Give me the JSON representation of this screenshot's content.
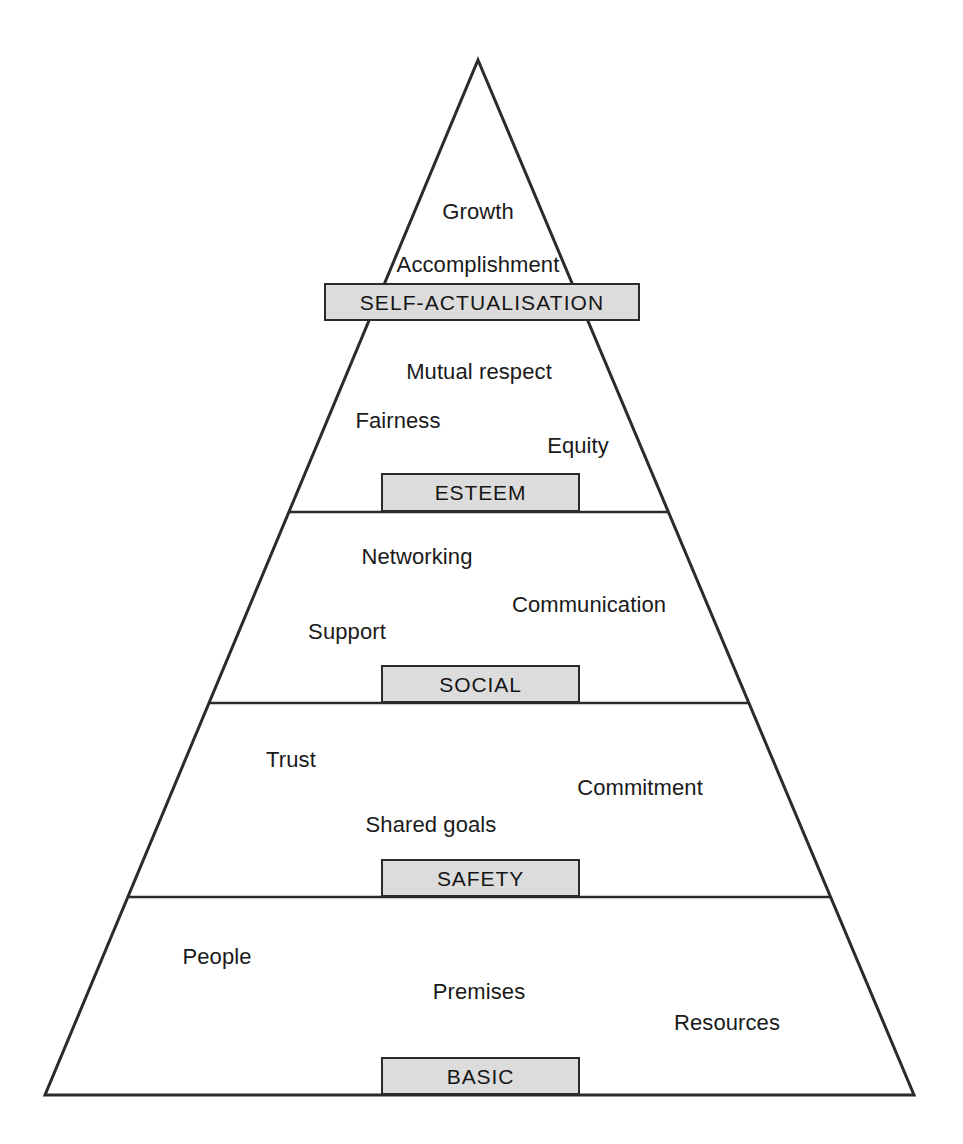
{
  "diagram": {
    "type": "pyramid-hierarchy",
    "title": "",
    "background_color": "#ffffff",
    "outline_color": "#2b2b2b",
    "box_fill_color": "#dcdcdc",
    "text_color": "#1a1a1a",
    "geometry": {
      "apex": {
        "x": 478,
        "y": 60
      },
      "bottom_left": {
        "x": 45,
        "y": 1095
      },
      "bottom_right": {
        "x": 914,
        "y": 1095
      },
      "divider_y": [
        512,
        703,
        897
      ]
    },
    "levels": [
      {
        "id": "self-actualisation",
        "label": "SELF-ACTUALISATION",
        "rank": 5,
        "box": {
          "x": 324,
          "y": 283,
          "width": 316,
          "height": 38
        },
        "keywords": [
          {
            "text": "Growth",
            "x": 478,
            "y": 212
          },
          {
            "text": "Accomplishment",
            "x": 478,
            "y": 265
          }
        ]
      },
      {
        "id": "esteem",
        "label": "ESTEEM",
        "rank": 4,
        "box": {
          "x": 381,
          "y": 473,
          "width": 199,
          "height": 39
        },
        "keywords": [
          {
            "text": "Mutual respect",
            "x": 479,
            "y": 372
          },
          {
            "text": "Fairness",
            "x": 398,
            "y": 421
          },
          {
            "text": "Equity",
            "x": 578,
            "y": 446
          }
        ]
      },
      {
        "id": "social",
        "label": "SOCIAL",
        "rank": 3,
        "box": {
          "x": 381,
          "y": 665,
          "width": 199,
          "height": 38
        },
        "keywords": [
          {
            "text": "Networking",
            "x": 417,
            "y": 557
          },
          {
            "text": "Communication",
            "x": 589,
            "y": 605
          },
          {
            "text": "Support",
            "x": 347,
            "y": 632
          }
        ]
      },
      {
        "id": "safety",
        "label": "SAFETY",
        "rank": 2,
        "box": {
          "x": 381,
          "y": 859,
          "width": 199,
          "height": 38
        },
        "keywords": [
          {
            "text": "Trust",
            "x": 291,
            "y": 760
          },
          {
            "text": "Commitment",
            "x": 640,
            "y": 788
          },
          {
            "text": "Shared goals",
            "x": 431,
            "y": 825
          }
        ]
      },
      {
        "id": "basic",
        "label": "BASIC",
        "rank": 1,
        "box": {
          "x": 381,
          "y": 1057,
          "width": 199,
          "height": 38
        },
        "keywords": [
          {
            "text": "People",
            "x": 217,
            "y": 957
          },
          {
            "text": "Premises",
            "x": 479,
            "y": 992
          },
          {
            "text": "Resources",
            "x": 727,
            "y": 1023
          }
        ]
      }
    ]
  }
}
